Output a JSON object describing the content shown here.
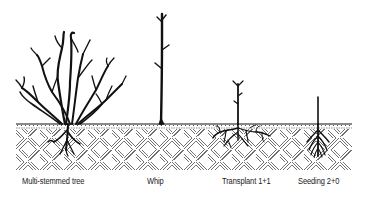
{
  "figure": {
    "ground": {
      "x": 16,
      "y_top": 124,
      "width": 336,
      "height": 46
    },
    "colors": {
      "ink": "#111111",
      "background": "#ffffff",
      "hatch": "#333333"
    }
  },
  "labels": [
    {
      "id": "multi-stemmed-tree",
      "text": "Multi-stemmed tree",
      "x": 22,
      "y": 179
    },
    {
      "id": "whip",
      "text": "Whip",
      "x": 147,
      "y": 179
    },
    {
      "id": "transplant",
      "text": "Transplant 1+1",
      "x": 222,
      "y": 179
    },
    {
      "id": "seeding",
      "text": "Seeding 2+0",
      "x": 299,
      "y": 179
    }
  ]
}
